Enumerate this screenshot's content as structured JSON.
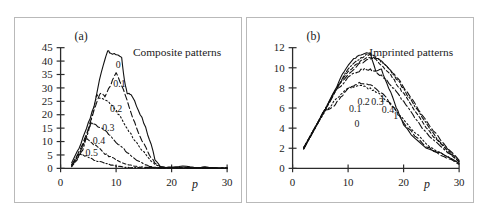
{
  "figure": {
    "background": "#ffffff",
    "curve_color": "#111111",
    "axis_color": "#2b2b2b",
    "border_color": "#b9b9b9"
  },
  "chart_data": [
    {
      "type": "line",
      "panel_tag": "(a)",
      "title": "Composite patterns",
      "xlabel": "p",
      "ylabel": "",
      "xlim": [
        0,
        30
      ],
      "ylim": [
        0,
        45
      ],
      "xticks": [
        0,
        10,
        20,
        30
      ],
      "yticks": [
        0,
        5,
        10,
        15,
        20,
        25,
        30,
        35,
        40,
        45
      ],
      "grid": false,
      "legend": "inline curve labels",
      "series": [
        {
          "name": "0",
          "label": "0",
          "style": "solid",
          "label_xy": [
            10.4,
            37.5
          ],
          "x": [
            2,
            3,
            4,
            5,
            6,
            7,
            8,
            8.5,
            9,
            10,
            11,
            11.5,
            12,
            12.5,
            13,
            14,
            15,
            16,
            17,
            18,
            19,
            20,
            22,
            24,
            26,
            28,
            30
          ],
          "y": [
            2.0,
            6.0,
            11.0,
            17.0,
            23.0,
            33.0,
            41.0,
            44.0,
            43.0,
            42.5,
            41.0,
            33.0,
            28.0,
            27.5,
            26.5,
            22.0,
            17.0,
            11.0,
            3.5,
            0.6,
            0.3,
            0.5,
            0.9,
            0.3,
            0.5,
            0.2,
            0.1
          ]
        },
        {
          "name": "0.1",
          "label": "0.1",
          "style": "dashed",
          "label_xy": [
            10.6,
            30.5
          ],
          "x": [
            2,
            3,
            4,
            5,
            6,
            7,
            7.5,
            8,
            9,
            10,
            11,
            12,
            13,
            14,
            15,
            16,
            17,
            18,
            19,
            20,
            22,
            24,
            26,
            28,
            30
          ],
          "y": [
            1.5,
            5.0,
            9.5,
            15.0,
            21.5,
            27.5,
            28.0,
            27.0,
            31.0,
            36.0,
            31.0,
            25.0,
            19.0,
            13.5,
            9.0,
            5.0,
            2.0,
            0.6,
            0.3,
            0.3,
            0.4,
            0.2,
            0.3,
            0.1,
            0.1
          ]
        },
        {
          "name": "0.2",
          "label": "0.2",
          "style": "dotted",
          "label_xy": [
            10.0,
            21.0
          ],
          "x": [
            2,
            3,
            4,
            5,
            6,
            6.5,
            7,
            8,
            9,
            10,
            11,
            12,
            13,
            14,
            15,
            16,
            17,
            18,
            19,
            20,
            22,
            24,
            26,
            28,
            30
          ],
          "y": [
            1.2,
            4.2,
            8.0,
            13.5,
            22.5,
            27.5,
            26.5,
            25.5,
            24.0,
            21.5,
            18.5,
            15.0,
            11.5,
            8.5,
            6.0,
            3.5,
            1.5,
            0.5,
            0.3,
            0.3,
            0.2,
            0.2,
            0.1,
            0.1,
            0.1
          ]
        },
        {
          "name": "0.3",
          "label": "0.3",
          "style": "dashdot",
          "label_xy": [
            8.6,
            14.0
          ],
          "x": [
            2,
            3,
            4,
            5,
            5.5,
            6,
            7,
            8,
            9,
            10,
            11,
            12,
            13,
            14,
            15,
            16,
            17,
            18,
            20,
            22,
            24,
            26,
            28,
            30
          ],
          "y": [
            1.0,
            3.5,
            7.0,
            14.5,
            17.0,
            16.8,
            15.5,
            14.0,
            12.0,
            10.0,
            8.0,
            6.0,
            4.2,
            2.8,
            1.6,
            0.8,
            0.4,
            0.3,
            0.2,
            0.2,
            0.1,
            0.1,
            0.1,
            0.1
          ]
        },
        {
          "name": "0.4",
          "label": "0.4",
          "style": "dashed-short",
          "label_xy": [
            6.9,
            9.2
          ],
          "x": [
            2,
            3,
            4,
            4.5,
            5,
            6,
            7,
            8,
            9,
            10,
            11,
            12,
            13,
            14,
            15,
            16,
            18,
            20,
            24,
            28,
            30
          ],
          "y": [
            0.8,
            3.0,
            8.5,
            11.2,
            10.5,
            9.0,
            7.2,
            5.6,
            4.2,
            3.0,
            2.2,
            1.5,
            1.0,
            0.6,
            0.4,
            0.3,
            0.2,
            0.2,
            0.1,
            0.1,
            0.1
          ]
        },
        {
          "name": "0.5",
          "label": "0.5",
          "style": "dashdot-short",
          "label_xy": [
            5.6,
            4.6
          ],
          "x": [
            2,
            3,
            3.5,
            4,
            5,
            6,
            7,
            8,
            9,
            10,
            11,
            12,
            13,
            14,
            16,
            18,
            20,
            24,
            28,
            30
          ],
          "y": [
            0.6,
            4.5,
            5.5,
            5.2,
            4.4,
            3.4,
            2.6,
            1.9,
            1.3,
            0.9,
            0.6,
            0.4,
            0.3,
            0.2,
            0.2,
            0.1,
            0.1,
            0.1,
            0.1,
            0.1
          ]
        }
      ]
    },
    {
      "type": "line",
      "panel_tag": "(b)",
      "title": "Imprinted patterns",
      "xlabel": "p",
      "ylabel": "",
      "xlim": [
        0,
        30
      ],
      "ylim": [
        0,
        12
      ],
      "xticks": [
        0,
        10,
        20,
        30
      ],
      "yticks": [
        0,
        2,
        4,
        6,
        8,
        10,
        12
      ],
      "grid": false,
      "legend": "inline curve labels",
      "series": [
        {
          "name": "0",
          "label": "0",
          "style": "solid",
          "label_xy": [
            11.6,
            4.1
          ],
          "x": [
            2,
            4,
            6,
            8,
            9,
            10,
            11,
            12,
            13,
            14,
            15,
            16,
            17,
            18,
            19,
            20,
            22,
            24,
            26,
            28,
            30
          ],
          "y": [
            2.0,
            4.0,
            6.0,
            8.2,
            9.3,
            10.3,
            10.9,
            11.2,
            11.5,
            11.4,
            9.6,
            9.8,
            8.4,
            7.1,
            5.6,
            4.3,
            2.9,
            2.1,
            1.6,
            1.2,
            0.5
          ]
        },
        {
          "name": "0.1",
          "label": "0.1",
          "style": "dashed",
          "label_xy": [
            11.3,
            5.6
          ],
          "x": [
            2,
            4,
            6,
            7,
            8,
            9,
            10,
            11,
            12,
            13,
            14,
            15,
            16,
            17,
            18,
            19,
            20,
            22,
            24,
            26,
            28,
            30
          ],
          "y": [
            2.0,
            4.0,
            5.9,
            6.0,
            6.6,
            7.3,
            7.9,
            8.3,
            8.5,
            8.5,
            8.3,
            8.0,
            7.5,
            6.9,
            6.2,
            5.4,
            4.6,
            3.2,
            2.2,
            1.5,
            1.0,
            0.4
          ]
        },
        {
          "name": "0.2",
          "label": "0.2",
          "style": "dotted",
          "label_xy": [
            12.8,
            6.3
          ],
          "x": [
            2,
            4,
            6,
            7,
            8,
            9,
            10,
            11,
            12,
            13,
            14,
            15,
            16,
            17,
            18,
            19,
            20,
            22,
            24,
            26,
            28,
            30
          ],
          "y": [
            2.0,
            4.0,
            5.8,
            6.3,
            7.0,
            7.5,
            7.9,
            8.1,
            8.2,
            8.1,
            7.9,
            7.6,
            7.2,
            6.7,
            6.1,
            5.5,
            4.9,
            3.6,
            2.5,
            1.7,
            1.1,
            0.5
          ]
        },
        {
          "name": "0.3",
          "label": "0.3",
          "style": "dashdot",
          "label_xy": [
            15.3,
            6.3
          ],
          "x": [
            2,
            4,
            6,
            8,
            10,
            11,
            12,
            13,
            14,
            15,
            16,
            17,
            18,
            19,
            20,
            21,
            22,
            24,
            26,
            28,
            30
          ],
          "y": [
            2.0,
            4.0,
            6.0,
            7.8,
            9.0,
            9.4,
            9.7,
            9.9,
            9.8,
            9.6,
            9.2,
            8.7,
            8.1,
            7.4,
            6.6,
            5.8,
            5.0,
            3.6,
            2.5,
            1.6,
            0.6
          ]
        },
        {
          "name": "0.4",
          "label": "0.4",
          "style": "dashed-short",
          "label_xy": [
            17.2,
            5.5
          ],
          "x": [
            2,
            4,
            6,
            8,
            10,
            12,
            13,
            14,
            15,
            16,
            17,
            18,
            19,
            20,
            22,
            24,
            26,
            28,
            30
          ],
          "y": [
            2.0,
            4.0,
            6.0,
            8.0,
            9.6,
            10.6,
            10.9,
            11.1,
            10.8,
            10.3,
            9.7,
            9.0,
            8.2,
            7.4,
            5.7,
            4.1,
            2.8,
            1.7,
            0.7
          ]
        },
        {
          "name": "1",
          "label": "1",
          "style": "dashdot-short",
          "label_xy": [
            16.2,
            6.6
          ],
          "x": [
            2,
            4,
            6,
            8,
            10,
            12,
            13,
            14,
            15,
            16,
            17,
            18,
            19,
            20,
            22,
            24,
            26,
            28,
            30
          ],
          "y": [
            2.0,
            4.0,
            6.0,
            8.1,
            9.8,
            10.9,
            11.2,
            11.4,
            11.0,
            10.6,
            10.1,
            9.4,
            8.7,
            7.9,
            6.2,
            4.5,
            3.0,
            1.8,
            0.8
          ]
        },
        {
          "name": "1b",
          "label": "1",
          "style": "dashed",
          "label_xy": [
            18.6,
            4.9
          ],
          "x": [
            2,
            4,
            6,
            8,
            10,
            12,
            14,
            15,
            16,
            17,
            18,
            19,
            20,
            21,
            22,
            24,
            26,
            28,
            30
          ],
          "y": [
            2.0,
            4.0,
            6.0,
            8.0,
            9.4,
            10.4,
            10.9,
            11.0,
            10.7,
            10.2,
            9.6,
            8.9,
            8.1,
            7.3,
            6.5,
            4.8,
            3.3,
            2.0,
            0.9
          ]
        }
      ]
    }
  ]
}
